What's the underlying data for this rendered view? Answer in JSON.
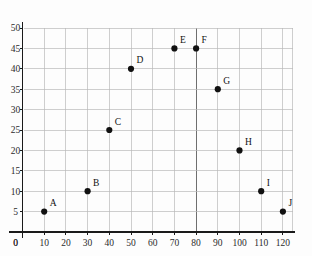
{
  "chart_data": {
    "type": "scatter",
    "title": "",
    "xlabel": "",
    "ylabel": "",
    "xlim": [
      0,
      125
    ],
    "ylim": [
      0,
      52
    ],
    "grid": true,
    "legend": "none",
    "x_ticks": [
      0,
      10,
      20,
      30,
      40,
      50,
      60,
      70,
      80,
      90,
      100,
      110,
      120
    ],
    "y_ticks": [
      0,
      5,
      10,
      15,
      20,
      25,
      30,
      35,
      40,
      45,
      50
    ],
    "x_tick_labels": [
      "0",
      "10",
      "20",
      "30",
      "40",
      "50",
      "60",
      "70",
      "80",
      "90",
      "100",
      "110",
      "120"
    ],
    "y_tick_labels": [
      "0",
      "5",
      "10",
      "15",
      "20",
      "25",
      "30",
      "35",
      "40",
      "45",
      "50"
    ],
    "emphasized_gridline_x": 80,
    "points": [
      {
        "label": "A",
        "x": 10,
        "y": 5
      },
      {
        "label": "B",
        "x": 30,
        "y": 10
      },
      {
        "label": "C",
        "x": 40,
        "y": 25
      },
      {
        "label": "D",
        "x": 50,
        "y": 40
      },
      {
        "label": "E",
        "x": 70,
        "y": 45
      },
      {
        "label": "F",
        "x": 80,
        "y": 45
      },
      {
        "label": "G",
        "x": 90,
        "y": 35
      },
      {
        "label": "H",
        "x": 100,
        "y": 20
      },
      {
        "label": "I",
        "x": 110,
        "y": 10
      },
      {
        "label": "J",
        "x": 120,
        "y": 5
      }
    ],
    "colors": {
      "background": "#fdfdfd",
      "grid": "#b9b9b9",
      "grid_strong": "#6f6f6f",
      "axis": "#1a1a1a",
      "marker": "#111111",
      "text": "#2b2b2b"
    }
  }
}
